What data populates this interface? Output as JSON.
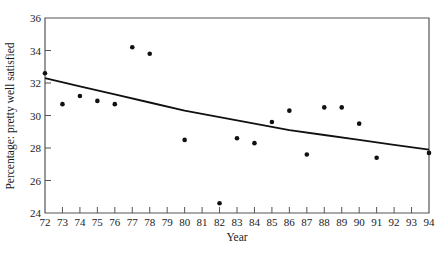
{
  "chart_data": {
    "type": "scatter",
    "title": "",
    "xlabel": "Year",
    "ylabel": "Percentage: pretty well satisfied",
    "xlim": [
      72,
      94
    ],
    "ylim": [
      24,
      36
    ],
    "x_ticks": [
      72,
      73,
      74,
      75,
      76,
      77,
      78,
      79,
      80,
      81,
      82,
      83,
      84,
      85,
      86,
      87,
      88,
      89,
      90,
      91,
      92,
      93,
      94
    ],
    "y_ticks": [
      24,
      26,
      28,
      30,
      32,
      34,
      36
    ],
    "grid": false,
    "legend": null,
    "series": [
      {
        "name": "observed",
        "kind": "points",
        "x": [
          72,
          73,
          74,
          75,
          76,
          77,
          78,
          80,
          82,
          83,
          84,
          85,
          86,
          87,
          88,
          89,
          90,
          91,
          94
        ],
        "y": [
          32.6,
          30.7,
          31.2,
          30.9,
          30.7,
          34.2,
          33.8,
          28.5,
          24.6,
          28.6,
          28.3,
          29.6,
          30.3,
          27.6,
          30.5,
          30.5,
          29.5,
          27.4,
          27.7
        ]
      },
      {
        "name": "fitted trend",
        "kind": "curve",
        "x": [
          72,
          74,
          76,
          78,
          80,
          82,
          84,
          86,
          88,
          90,
          92,
          94
        ],
        "y": [
          32.3,
          31.8,
          31.3,
          30.8,
          30.3,
          29.9,
          29.5,
          29.1,
          28.8,
          28.5,
          28.2,
          27.9
        ]
      }
    ]
  },
  "colors": {
    "axis": "#555555",
    "points": "#111111",
    "curve": "#111111",
    "background": "#ffffff"
  }
}
